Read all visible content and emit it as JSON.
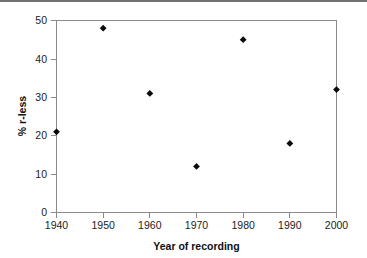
{
  "figure": {
    "background_color": "#ffffff",
    "top_rule_color": "#58585a",
    "frame_color": "#8a8a8a",
    "marker_color": "#0a0a0a"
  },
  "chart_data": {
    "type": "scatter",
    "title": "",
    "xlabel": "Year of recording",
    "ylabel": "% r-less",
    "x": [
      1940,
      1950,
      1960,
      1970,
      1980,
      1990,
      2000
    ],
    "values": [
      21,
      48,
      31,
      12,
      45,
      18,
      32
    ],
    "points": [
      {
        "x": 1940,
        "y": 21
      },
      {
        "x": 1950,
        "y": 48
      },
      {
        "x": 1960,
        "y": 31
      },
      {
        "x": 1970,
        "y": 12
      },
      {
        "x": 1980,
        "y": 45
      },
      {
        "x": 1990,
        "y": 18
      },
      {
        "x": 2000,
        "y": 32
      }
    ],
    "xlim": [
      1940,
      2000
    ],
    "ylim": [
      0,
      50
    ],
    "xticks": [
      1940,
      1950,
      1960,
      1970,
      1980,
      1990,
      2000
    ],
    "xtick_labels": [
      "1940",
      "1950",
      "1960",
      "1970",
      "1980",
      "1990",
      "2000"
    ],
    "yticks": [
      0,
      10,
      20,
      30,
      40,
      50
    ],
    "ytick_labels": [
      "0",
      "10",
      "20",
      "30",
      "40",
      "50"
    ],
    "grid": false,
    "legend": null,
    "marker_shape": "diamond",
    "series_name": "% r-less"
  }
}
